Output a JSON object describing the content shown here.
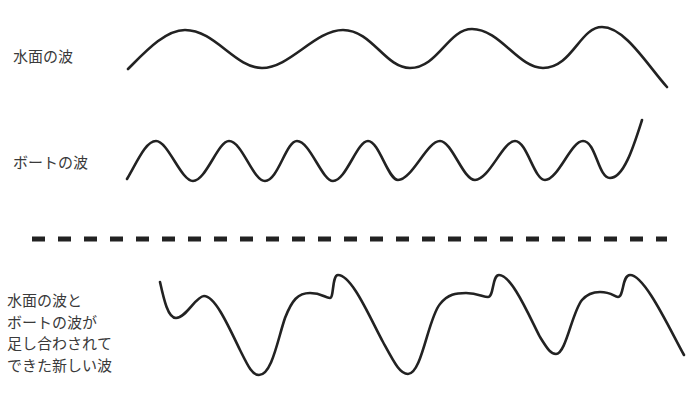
{
  "labels": {
    "surface_wave": "水面の波",
    "boat_wave": "ボートの波",
    "combined_wave_lines": [
      "水面の波と",
      "ボートの波が",
      "足し合わされて",
      "できた新しい波"
    ]
  },
  "diagram": {
    "type": "wave-superposition",
    "rows": [
      {
        "name": "surface-wave",
        "description": "long-wavelength sine wave",
        "approx_peaks": 4
      },
      {
        "name": "boat-wave",
        "description": "short-wavelength sine wave",
        "approx_peaks": 8
      },
      {
        "name": "combined-wave",
        "description": "sum of surface and boat waves"
      }
    ],
    "separator": "dashed-line",
    "colors": {
      "stroke": "#222222",
      "text": "#3a3a3a",
      "background": "#ffffff"
    }
  }
}
